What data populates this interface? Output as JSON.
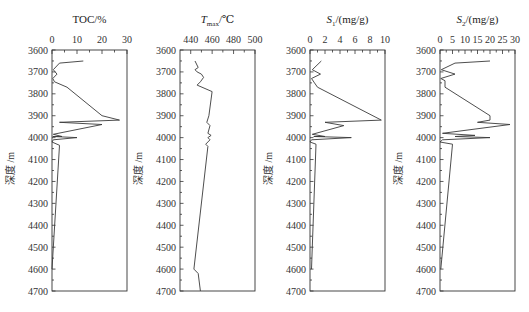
{
  "figure": {
    "ylabel": "深度 /m",
    "depth_ticks": [
      "3600",
      "3700",
      "3800",
      "3900",
      "4000",
      "4100",
      "4200",
      "4300",
      "4400",
      "4500",
      "4600",
      "4700"
    ]
  },
  "chart_data": [
    {
      "type": "line",
      "title": "TOC/%",
      "xlabel": "TOC/%",
      "ylabel": "深度 /m",
      "xlim": [
        0,
        30
      ],
      "ylim": [
        4700,
        3600
      ],
      "xticks": [
        "0",
        "10",
        "20",
        "30"
      ],
      "orientation": "depth-profile",
      "points": [
        [
          12.5,
          3650
        ],
        [
          3,
          3660
        ],
        [
          0.5,
          3690
        ],
        [
          2,
          3710
        ],
        [
          0.3,
          3730
        ],
        [
          1,
          3745
        ],
        [
          6,
          3770
        ],
        [
          20,
          3900
        ],
        [
          27,
          3920
        ],
        [
          3,
          3930
        ],
        [
          20,
          3940
        ],
        [
          0.5,
          3985
        ],
        [
          4,
          3995
        ],
        [
          0.3,
          3995
        ],
        [
          10,
          4000
        ],
        [
          0.5,
          4010
        ],
        [
          0,
          4020
        ],
        [
          3,
          4035
        ],
        [
          0,
          4600
        ]
      ]
    },
    {
      "type": "line",
      "title": "Tmax/℃",
      "xlabel": "Tmax/℃",
      "ylabel": "深度 /m",
      "xlim": [
        430,
        500
      ],
      "ylim": [
        4700,
        3600
      ],
      "xticks": [
        "440",
        "460",
        "480",
        "500"
      ],
      "orientation": "depth-profile",
      "points": [
        [
          444,
          3650
        ],
        [
          447,
          3680
        ],
        [
          444,
          3690
        ],
        [
          446,
          3700
        ],
        [
          450,
          3710
        ],
        [
          452,
          3725
        ],
        [
          449,
          3745
        ],
        [
          446,
          3760
        ],
        [
          460,
          3790
        ],
        [
          457,
          3900
        ],
        [
          455,
          3930
        ],
        [
          458,
          3945
        ],
        [
          456,
          3980
        ],
        [
          459,
          3990
        ],
        [
          456,
          4000
        ],
        [
          458,
          4010
        ],
        [
          454,
          4030
        ],
        [
          456,
          4040
        ],
        [
          443,
          4600
        ],
        [
          447,
          4620
        ],
        [
          449,
          4700
        ]
      ]
    },
    {
      "type": "line",
      "title": "S1/(mg/g)",
      "xlabel": "S1/(mg/g)",
      "ylabel": "深度 /m",
      "xlim": [
        0,
        10
      ],
      "ylim": [
        4700,
        3600
      ],
      "xticks": [
        "0",
        "2",
        "4",
        "6",
        "8",
        "10"
      ],
      "orientation": "depth-profile",
      "points": [
        [
          1.5,
          3650
        ],
        [
          0.3,
          3690
        ],
        [
          1.4,
          3710
        ],
        [
          0.2,
          3730
        ],
        [
          0.6,
          3750
        ],
        [
          1,
          3770
        ],
        [
          9.5,
          3920
        ],
        [
          2,
          3930
        ],
        [
          4.5,
          3945
        ],
        [
          0.3,
          3985
        ],
        [
          2,
          3995
        ],
        [
          0.5,
          3995
        ],
        [
          5.5,
          4000
        ],
        [
          0.2,
          4010
        ],
        [
          0,
          4020
        ],
        [
          0.8,
          4030
        ],
        [
          0.2,
          4600
        ]
      ]
    },
    {
      "type": "line",
      "title": "S2/(mg/g)",
      "xlabel": "S2/(mg/g)",
      "ylabel": "深度 /m",
      "xlim": [
        0,
        30
      ],
      "ylim": [
        4700,
        3600
      ],
      "xticks": [
        "0",
        "5",
        "10",
        "15",
        "20",
        "25",
        "30"
      ],
      "orientation": "depth-profile",
      "points": [
        [
          20,
          3650
        ],
        [
          6,
          3660
        ],
        [
          0.5,
          3690
        ],
        [
          6,
          3710
        ],
        [
          0.3,
          3730
        ],
        [
          2,
          3740
        ],
        [
          2,
          3770
        ],
        [
          20,
          3900
        ],
        [
          20,
          3920
        ],
        [
          15,
          3930
        ],
        [
          28,
          3940
        ],
        [
          1,
          3980
        ],
        [
          14,
          3990
        ],
        [
          6,
          3995
        ],
        [
          20,
          4000
        ],
        [
          1,
          4010
        ],
        [
          0,
          4020
        ],
        [
          5,
          4030
        ],
        [
          0.3,
          4600
        ]
      ]
    }
  ]
}
